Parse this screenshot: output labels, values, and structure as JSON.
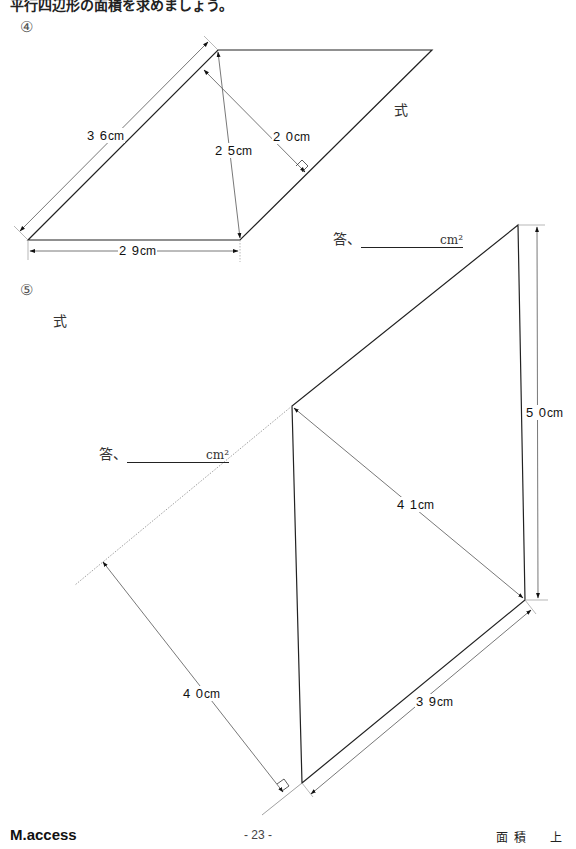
{
  "header": {
    "cut_text": "平行四辺形の面積を求めましょう。"
  },
  "problems": [
    {
      "number": "④",
      "shape": "parallelogram",
      "formula_label": "式",
      "answer_label": "答、",
      "answer_unit": "cm²",
      "dimensions": [
        {
          "id": "side",
          "text": "3 6",
          "unit": "cm"
        },
        {
          "id": "diag",
          "text": "2 5",
          "unit": "cm"
        },
        {
          "id": "height",
          "text": "2 0",
          "unit": "cm"
        },
        {
          "id": "base",
          "text": "2 9",
          "unit": "cm"
        }
      ]
    },
    {
      "number": "⑤",
      "shape": "parallelogram",
      "formula_label": "式",
      "answer_label": "答、",
      "answer_unit": "cm²",
      "dimensions": [
        {
          "id": "side",
          "text": "5 0",
          "unit": "cm"
        },
        {
          "id": "diag",
          "text": "4 1",
          "unit": "cm"
        },
        {
          "id": "height",
          "text": "4 0",
          "unit": "cm"
        },
        {
          "id": "base",
          "text": "3 9",
          "unit": "cm"
        }
      ]
    }
  ],
  "footer": {
    "brand": "M.access",
    "page": "- 23 -",
    "unit_title": "面積　上"
  },
  "colors": {
    "line": "#222222",
    "dim_line": "#555555",
    "text": "#111111"
  }
}
